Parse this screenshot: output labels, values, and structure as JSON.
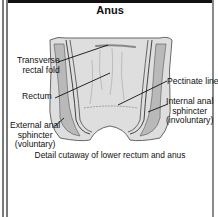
{
  "title": "Anus",
  "labels": {
    "transverse_rectal_fold": [
      "Transverse",
      "rectal fold"
    ],
    "rectum": "Rectum",
    "external_anal_sphincter": [
      "External anal",
      "sphincter",
      "(voluntary)"
    ],
    "pectinate_line": "Pectinate line",
    "internal_anal_sphincter": [
      "Internal anal",
      "sphincter",
      "(involuntary)"
    ]
  },
  "caption": "Detail cutaway of lower rectum and anus",
  "colors": {
    "tissue_fill": "#d9d9d9",
    "muscle_fill": "#b5b5b5",
    "outline": "#333333",
    "leader_line": "#111111"
  }
}
